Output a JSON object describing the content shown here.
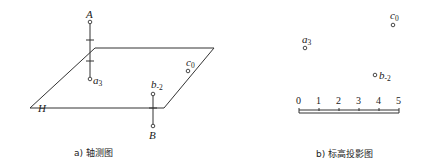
{
  "figure": {
    "left_panel": {
      "caption": "a) 轴测图",
      "plane_label": "H",
      "points": {
        "A": {
          "label": "A"
        },
        "a3": {
          "label": "a",
          "subscript": "3"
        },
        "c0": {
          "label": "c",
          "subscript": "0"
        },
        "b_2": {
          "label": "b",
          "subscript": "-2"
        },
        "B": {
          "label": "B"
        }
      }
    },
    "right_panel": {
      "caption": "b) 标高投影图",
      "points": {
        "a3": {
          "label": "a",
          "subscript": "3"
        },
        "c0": {
          "label": "c",
          "subscript": "0"
        },
        "b_2": {
          "label": "b",
          "subscript": "-2"
        }
      },
      "scale": {
        "ticks": [
          "0",
          "1",
          "2",
          "3",
          "4",
          "5"
        ]
      }
    }
  }
}
